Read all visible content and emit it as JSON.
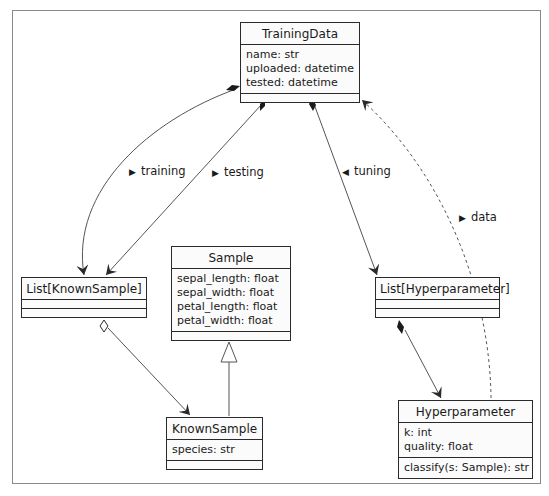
{
  "diagram": {
    "type": "UML class diagram",
    "classes": {
      "training_data": {
        "name": "TrainingData",
        "attributes": [
          "name: str",
          "uploaded: datetime",
          "tested: datetime"
        ],
        "operations": []
      },
      "list_known_sample": {
        "name": "List[KnownSample]",
        "attributes": [],
        "operations": []
      },
      "sample": {
        "name": "Sample",
        "attributes": [
          "sepal_length: float",
          "sepal_width: float",
          "petal_length: float",
          "petal_width: float"
        ],
        "operations": []
      },
      "list_hyperparameter": {
        "name": "List[Hyperparameter]",
        "attributes": [],
        "operations": []
      },
      "known_sample": {
        "name": "KnownSample",
        "attributes": [
          "species: str"
        ],
        "operations": []
      },
      "hyperparameter": {
        "name": "Hyperparameter",
        "attributes": [
          "k: int",
          "quality: float"
        ],
        "operations": [
          "classify(s: Sample): str"
        ]
      }
    },
    "relations": [
      {
        "from": "TrainingData",
        "to": "List[KnownSample]",
        "kind": "composition",
        "label": "training",
        "label_arrow": "▶"
      },
      {
        "from": "TrainingData",
        "to": "List[KnownSample]",
        "kind": "composition",
        "label": "testing",
        "label_arrow": "▶"
      },
      {
        "from": "TrainingData",
        "to": "List[Hyperparameter]",
        "kind": "composition",
        "label": "tuning",
        "label_arrow": "◀"
      },
      {
        "from": "Hyperparameter",
        "to": "TrainingData",
        "kind": "dependency",
        "style": "dashed",
        "label": "data",
        "label_arrow": "▶"
      },
      {
        "from": "List[KnownSample]",
        "to": "KnownSample",
        "kind": "aggregation",
        "label": ""
      },
      {
        "from": "KnownSample",
        "to": "Sample",
        "kind": "generalization",
        "label": ""
      },
      {
        "from": "List[Hyperparameter]",
        "to": "Hyperparameter",
        "kind": "composition",
        "label": ""
      }
    ],
    "labels": {
      "training": "training",
      "testing": "testing",
      "tuning": "tuning",
      "data": "data",
      "arrow_right": "▶",
      "arrow_left": "◀"
    }
  },
  "colors": {
    "line": "#2a2a2a",
    "frame": "#8a8a8a",
    "box_fill": "#fbfbfb"
  }
}
